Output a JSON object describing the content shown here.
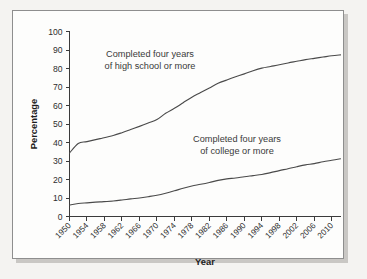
{
  "chart_data": {
    "type": "line",
    "title": "",
    "xlabel": "Year",
    "ylabel": "Percentage",
    "xlim": [
      1950,
      2012
    ],
    "ylim": [
      0,
      100
    ],
    "grid": false,
    "legend_position": "inline-annotations",
    "y_ticks": [
      0,
      10,
      20,
      30,
      40,
      50,
      60,
      70,
      80,
      90,
      100
    ],
    "x_ticks": [
      1950,
      1954,
      1958,
      1962,
      1966,
      1970,
      1974,
      1978,
      1982,
      1986,
      1990,
      1994,
      1998,
      2002,
      2006,
      2010
    ],
    "x_tick_labels": [
      "1950",
      "1954",
      "1958",
      "1962",
      "1966",
      "1970",
      "1974",
      "1978",
      "1982",
      "1986",
      "1990",
      "1994",
      "1998",
      "2002",
      "2006",
      "2010"
    ],
    "y_tick_labels": [
      "0",
      "10",
      "20",
      "30",
      "40",
      "50",
      "60",
      "70",
      "80",
      "90",
      "100"
    ],
    "series": [
      {
        "name": "Completed four years of high school or more",
        "color": "#4a4a4a",
        "x": [
          1950,
          1952,
          1954,
          1957,
          1960,
          1962,
          1964,
          1966,
          1968,
          1970,
          1972,
          1974,
          1976,
          1978,
          1980,
          1982,
          1984,
          1986,
          1988,
          1990,
          1992,
          1994,
          1996,
          1998,
          2000,
          2002,
          2004,
          2006,
          2008,
          2010,
          2012
        ],
        "values": [
          34.3,
          39.5,
          40.5,
          42.1,
          43.8,
          45.3,
          47.0,
          48.7,
          50.5,
          52.4,
          55.8,
          58.5,
          61.5,
          64.5,
          67.0,
          69.5,
          72.0,
          73.8,
          75.5,
          77.1,
          78.8,
          80.2,
          81.1,
          82.0,
          83.0,
          83.9,
          84.8,
          85.5,
          86.2,
          86.9,
          87.4
        ]
      },
      {
        "name": "Completed four years of college or more",
        "color": "#4a4a4a",
        "x": [
          1950,
          1952,
          1954,
          1957,
          1960,
          1962,
          1964,
          1966,
          1968,
          1970,
          1972,
          1974,
          1976,
          1978,
          1980,
          1982,
          1984,
          1986,
          1988,
          1990,
          1992,
          1994,
          1996,
          1998,
          2000,
          2002,
          2004,
          2006,
          2008,
          2010,
          2012
        ],
        "values": [
          6.2,
          7.0,
          7.4,
          7.9,
          8.4,
          8.9,
          9.5,
          10.0,
          10.7,
          11.5,
          12.6,
          13.9,
          15.3,
          16.5,
          17.4,
          18.4,
          19.5,
          20.3,
          20.8,
          21.5,
          22.1,
          22.7,
          23.7,
          24.8,
          25.8,
          26.9,
          27.9,
          28.6,
          29.6,
          30.4,
          31.2
        ]
      }
    ],
    "annotations": [
      {
        "id": "highschool-label",
        "line1": "Completed four years",
        "line2": "of high school or more"
      },
      {
        "id": "college-label",
        "line1": "Completed four years",
        "line2": "of college or more"
      }
    ]
  }
}
